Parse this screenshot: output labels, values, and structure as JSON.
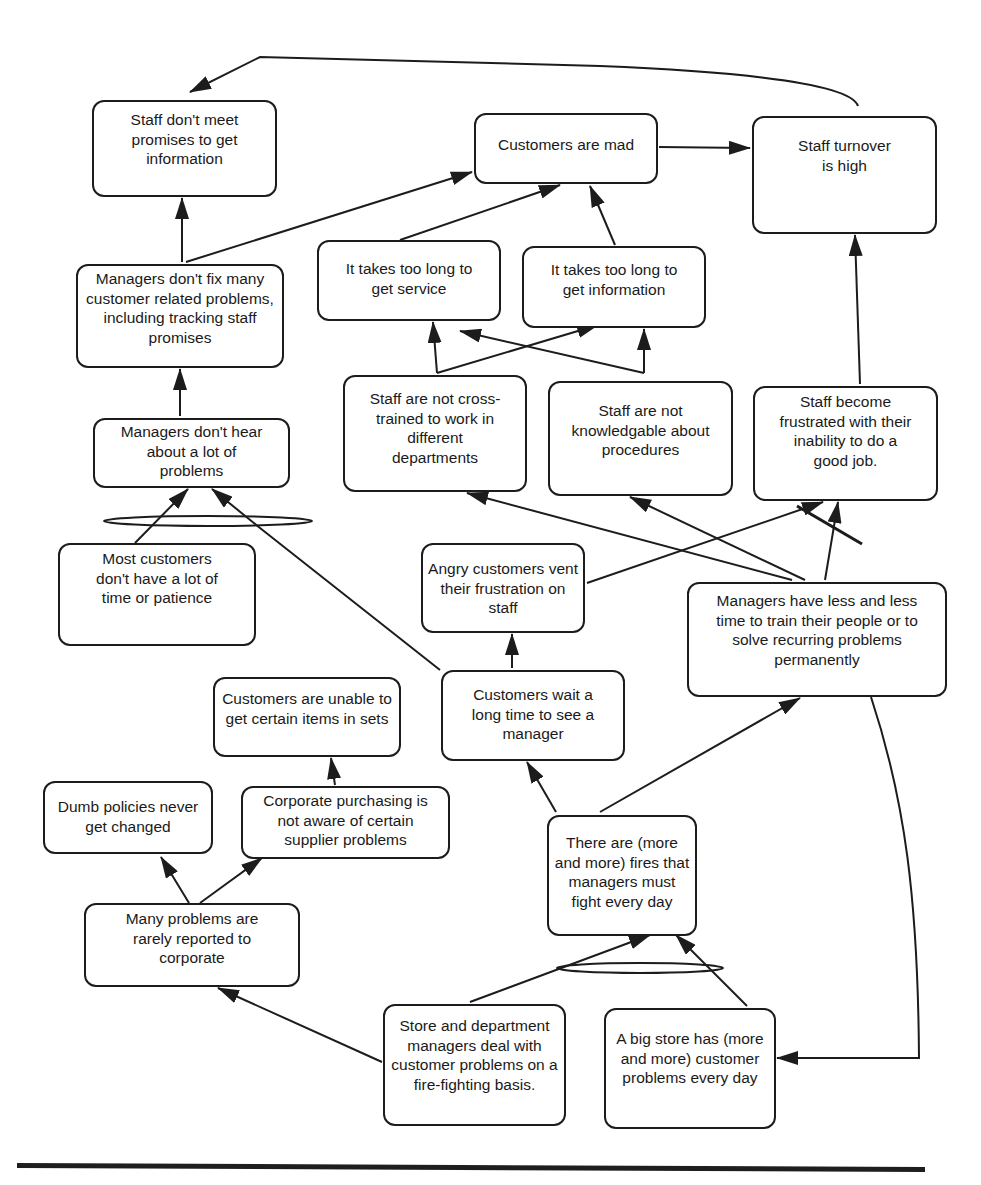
{
  "diagram": {
    "type": "current-reality-tree",
    "nodes": {
      "staff_dont_meet_promises": "Staff don't meet promises to get information",
      "customers_are_mad": "Customers are mad",
      "staff_turnover_high": "Staff turnover is high",
      "managers_dont_fix": "Managers don't fix many customer related problems, including tracking staff promises",
      "too_long_service": "It takes too long to get service",
      "too_long_information": "It takes too long to get information",
      "managers_dont_hear": "Managers don't hear about a lot of problems",
      "staff_not_cross_trained": "Staff are not cross-trained to work in different departments",
      "staff_not_knowledgable": "Staff are not knowledgable about procedures",
      "staff_frustrated": "Staff become frustrated with their inability to do a good job.",
      "most_customers_no_time": "Most customers don't have a lot of time or patience",
      "angry_customers_vent": "Angry customers vent their frustration on staff",
      "managers_less_time": "Managers have less and less time to train their people or to solve recurring problems permanently",
      "customers_unable_items": "Customers are unable to get certain items in sets",
      "customers_wait": "Customers wait a long time to see a manager",
      "dumb_policies": "Dumb policies never get changed",
      "corporate_purchasing": "Corporate purchasing is not aware of certain supplier problems",
      "problems_rarely_reported": "Many problems are rarely reported to corporate",
      "more_fires": "There are (more and more) fires that managers must fight every day",
      "fire_fighting_basis": "Store and department managers deal with customer problems on a fire-fighting basis.",
      "big_store_problems": "A big store has (more and more) customer problems every day"
    },
    "edges": [
      {
        "from": "staff_turnover_high",
        "to": "staff_dont_meet_promises"
      },
      {
        "from": "customers_are_mad",
        "to": "staff_turnover_high"
      },
      {
        "from": "managers_dont_fix",
        "to": "staff_dont_meet_promises"
      },
      {
        "from": "managers_dont_fix",
        "to": "customers_are_mad"
      },
      {
        "from": "too_long_service",
        "to": "customers_are_mad"
      },
      {
        "from": "too_long_information",
        "to": "customers_are_mad"
      },
      {
        "from": "staff_not_cross_trained",
        "to": "too_long_service"
      },
      {
        "from": "staff_not_cross_trained",
        "to": "too_long_information"
      },
      {
        "from": "staff_not_knowledgable",
        "to": "too_long_service"
      },
      {
        "from": "staff_not_knowledgable",
        "to": "too_long_information"
      },
      {
        "from": "staff_frustrated",
        "to": "staff_turnover_high"
      },
      {
        "from": "managers_dont_hear",
        "to": "managers_dont_fix"
      },
      {
        "from": "most_customers_no_time",
        "to": "managers_dont_hear",
        "and_group": 1
      },
      {
        "from": "customers_wait",
        "to": "managers_dont_hear",
        "and_group": 1
      },
      {
        "from": "managers_less_time",
        "to": "staff_not_cross_trained"
      },
      {
        "from": "managers_less_time",
        "to": "staff_not_knowledgable"
      },
      {
        "from": "managers_less_time",
        "to": "staff_frustrated",
        "and_group": 2
      },
      {
        "from": "angry_customers_vent",
        "to": "staff_frustrated",
        "and_group": 2
      },
      {
        "from": "customers_wait",
        "to": "angry_customers_vent"
      },
      {
        "from": "corporate_purchasing",
        "to": "customers_unable_items"
      },
      {
        "from": "problems_rarely_reported",
        "to": "dumb_policies"
      },
      {
        "from": "problems_rarely_reported",
        "to": "corporate_purchasing"
      },
      {
        "from": "more_fires",
        "to": "customers_wait"
      },
      {
        "from": "more_fires",
        "to": "managers_less_time"
      },
      {
        "from": "fire_fighting_basis",
        "to": "more_fires",
        "and_group": 3
      },
      {
        "from": "big_store_problems",
        "to": "more_fires",
        "and_group": 3
      },
      {
        "from": "fire_fighting_basis",
        "to": "problems_rarely_reported"
      },
      {
        "from": "managers_less_time",
        "to": "big_store_problems"
      }
    ],
    "line_color": "#1c1c1c",
    "background": "#ffffff"
  }
}
